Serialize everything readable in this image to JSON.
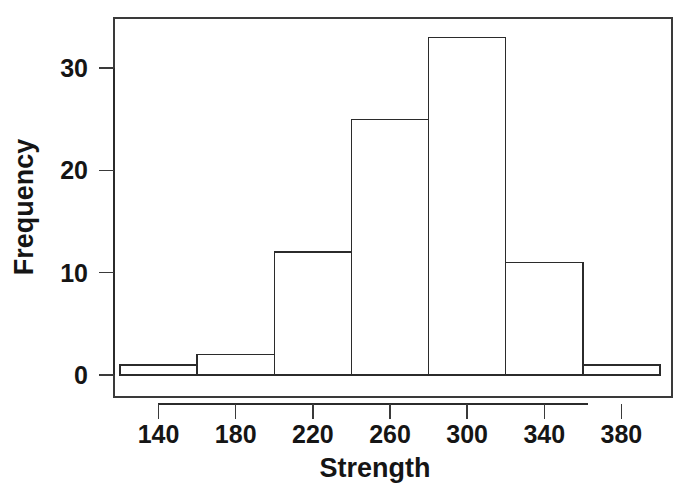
{
  "chart_data": {
    "type": "bar",
    "title": "",
    "subtitle": "",
    "xlabel": "Strength",
    "ylabel": "Frequency",
    "bin_edges": [
      120,
      160,
      200,
      240,
      280,
      320,
      360,
      400
    ],
    "bin_width": 40,
    "categories": [
      "120-160",
      "160-200",
      "200-240",
      "240-280",
      "280-320",
      "320-360",
      "360-400"
    ],
    "values": [
      1,
      2,
      12,
      25,
      33,
      11,
      1
    ],
    "bin_centers": [
      140,
      180,
      220,
      260,
      300,
      340,
      380
    ],
    "xlim": [
      120,
      400
    ],
    "ylim": [
      0,
      33
    ],
    "xticks": [
      140,
      180,
      220,
      260,
      300,
      340,
      380
    ],
    "xtick_labels": [
      "140",
      "180",
      "220",
      "260",
      "300",
      "340",
      "380"
    ],
    "yticks": [
      0,
      10,
      20,
      30
    ],
    "ytick_labels": [
      "0",
      "10",
      "20",
      "30"
    ],
    "grid": false,
    "legend": null,
    "bar_fill_color": "#ffffff",
    "bar_edge_color": "#2b2b2b",
    "background_color": "#ffffff",
    "frame_color": "#3a3a3a"
  },
  "axes": {
    "x_title": "Strength",
    "y_title": "Frequency"
  }
}
